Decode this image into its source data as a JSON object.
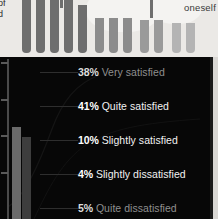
{
  "top_panel": {
    "left_fragment_line1": "of",
    "left_fragment_line2": "d",
    "right_label": "oneself",
    "background_color": "#ebe9e6",
    "bars": [
      {
        "x": 22,
        "width": 9,
        "height": 53,
        "color": "#6e6e6e"
      },
      {
        "x": 36,
        "width": 9,
        "height": 53,
        "color": "#6e6e6e"
      },
      {
        "x": 50,
        "width": 9,
        "height": 53,
        "color": "#6e6e6e"
      },
      {
        "x": 64,
        "width": 9,
        "height": 53,
        "color": "#6e6e6e"
      },
      {
        "x": 78,
        "width": 9,
        "height": 48,
        "color": "#6e6e6e"
      },
      {
        "x": 95,
        "width": 9,
        "height": 35,
        "color": "#8c8c8c"
      },
      {
        "x": 109,
        "width": 9,
        "height": 35,
        "color": "#8c8c8c"
      },
      {
        "x": 123,
        "width": 9,
        "height": 35,
        "color": "#8c8c8c"
      },
      {
        "x": 140,
        "width": 9,
        "height": 33,
        "color": "#9a9a9a"
      },
      {
        "x": 154,
        "width": 9,
        "height": 33,
        "color": "#9a9a9a"
      },
      {
        "x": 172,
        "width": 9,
        "height": 30,
        "color": "#b4b4b4"
      },
      {
        "x": 186,
        "width": 9,
        "height": 30,
        "color": "#b4b4b4"
      }
    ],
    "stalks": [
      {
        "x": 60,
        "top": -4,
        "height": 12
      },
      {
        "x": 150,
        "top": -4,
        "height": 22
      }
    ]
  },
  "dark_panel": {
    "background_color": "#070707",
    "axis": {
      "ticks_y": [
        5,
        42,
        78,
        115
      ]
    },
    "bars": [
      {
        "x": 12,
        "width": 9,
        "height": 92,
        "color": "#6a6a6a"
      },
      {
        "x": 22,
        "width": 9,
        "height": 82,
        "color": "#3d3d3d"
      }
    ]
  },
  "chart_data": {
    "type": "bar",
    "title": "",
    "subtitle": "",
    "xlabel": "",
    "ylabel": "",
    "categories": [
      "Very satisfied",
      "Quite satisfied",
      "Slightly satisfied",
      "Slightly dissatisfied",
      "Quite dissatisfied"
    ],
    "values": [
      38,
      41,
      10,
      4,
      5
    ],
    "value_suffix": "%",
    "grid": false,
    "legend_position": "right",
    "legend": [
      {
        "percent": "38%",
        "label": "Very satisfied",
        "value": 38,
        "emphasis": "dim"
      },
      {
        "percent": "41%",
        "label": "Quite satisfied",
        "value": 41,
        "emphasis": "bright"
      },
      {
        "percent": "10%",
        "label": "Slightly satisfied",
        "value": 10,
        "emphasis": "bright"
      },
      {
        "percent": "4%",
        "label": "Slightly dissatisfied",
        "value": 4,
        "emphasis": "bright"
      },
      {
        "percent": "5%",
        "label": "Quite dissatisfied",
        "value": 5,
        "emphasis": "dim"
      }
    ]
  }
}
